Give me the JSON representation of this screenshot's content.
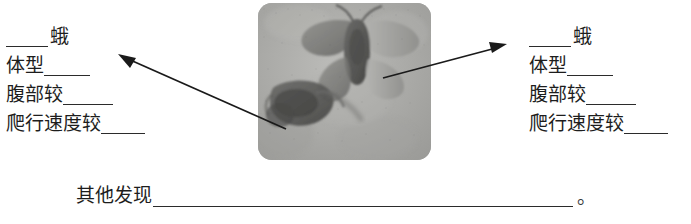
{
  "worksheet": {
    "left_block": {
      "name": "left-specimen-notes",
      "lines": [
        {
          "prefix": "",
          "label": "蛾",
          "blank_before": true,
          "blank_after": false
        },
        {
          "prefix": "体型",
          "label": "体型",
          "blank_before": false,
          "blank_after": true
        },
        {
          "prefix": "腹部较",
          "label": "腹部较",
          "blank_before": false,
          "blank_after": true
        },
        {
          "prefix": "爬行速度较",
          "label": "爬行速度较",
          "blank_before": false,
          "blank_after": true
        }
      ]
    },
    "right_block": {
      "name": "right-specimen-notes",
      "lines": [
        {
          "label": "蛾",
          "blank_before": true,
          "blank_after": false
        },
        {
          "label": "体型",
          "blank_before": false,
          "blank_after": true
        },
        {
          "label": "腹部较",
          "blank_before": false,
          "blank_after": true
        },
        {
          "label": "爬行速度较",
          "blank_before": false,
          "blank_after": true
        }
      ]
    },
    "other_findings": {
      "label": "其他发现",
      "period": "。"
    },
    "photo": {
      "caption": "",
      "alt_name": "moth-specimen-photo",
      "base_color": "#a9a9a7",
      "dark_color": "#5d5d5b",
      "light_color": "#c9c9c6"
    },
    "arrows": [
      {
        "name": "arrow-to-left-notes",
        "from_x": 286,
        "from_y": 129,
        "to_x": 120,
        "to_y": 56
      },
      {
        "name": "arrow-to-right-notes",
        "from_x": 383,
        "from_y": 78,
        "to_x": 506,
        "to_y": 44
      }
    ],
    "colors": {
      "ink": "#1d1d1d",
      "rule": "#2b2b2b",
      "paper": "#ffffff"
    }
  }
}
